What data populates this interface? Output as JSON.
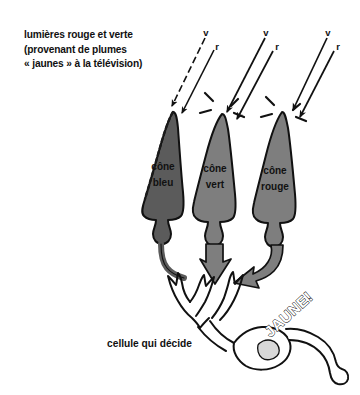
{
  "figure": {
    "title_caption": {
      "lines": [
        "lumières rouge et verte",
        "(provenant de plumes",
        "« jaunes » à la télévision)"
      ]
    },
    "light_rays": [
      {
        "group": 1,
        "target": "cone-bleu",
        "labels": {
          "v": "v",
          "r": "r"
        },
        "v_style": "dashed",
        "r_style": "solid"
      },
      {
        "group": 2,
        "target": "cone-vert",
        "labels": {
          "v": "v",
          "r": "r"
        },
        "v_style": "solid",
        "r_style": "solid"
      },
      {
        "group": 3,
        "target": "cone-rouge",
        "labels": {
          "v": "v",
          "r": "r"
        },
        "v_style": "solid",
        "r_style": "solid"
      }
    ],
    "cones": [
      {
        "id": "bleu",
        "label_line1": "cône",
        "label_line2": "bleu",
        "fill": "#5b5b5b",
        "outline": "#111111",
        "response": "none"
      },
      {
        "id": "vert",
        "label_line1": "cône",
        "label_line2": "vert",
        "fill": "#7e7e7e",
        "outline": "#111111",
        "response": "strong"
      },
      {
        "id": "rouge",
        "label_line1": "cône",
        "label_line2": "rouge",
        "fill": "#7e7e7e",
        "outline": "#111111",
        "response": "strong"
      }
    ],
    "decision_cell": {
      "label": "cellule qui décide",
      "nucleus_fill": "#d8d8d8",
      "body_fill": "#ffffff",
      "outline": "#111111"
    },
    "output_signal": {
      "text": "JAUNE!",
      "style": "outline-diagonal"
    },
    "colors": {
      "background": "#ffffff",
      "ink": "#111111",
      "cone_dark": "#5b5b5b",
      "cone_mid": "#7e7e7e",
      "nucleus": "#d8d8d8"
    }
  }
}
